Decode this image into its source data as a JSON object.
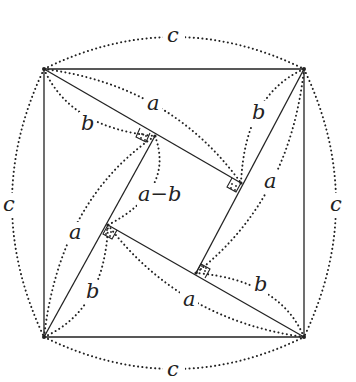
{
  "diagram": {
    "stroke_color": "#222222",
    "background": "#ffffff",
    "outer_square": {
      "corners": [
        [
          44,
          69
        ],
        [
          304,
          69
        ],
        [
          304,
          337
        ],
        [
          44,
          337
        ]
      ],
      "side_label": "c"
    },
    "inner_square": {
      "corners": [
        [
          155,
          136
        ],
        [
          241,
          183
        ],
        [
          196,
          273
        ],
        [
          108,
          225
        ]
      ],
      "side_label": "a−b"
    },
    "labels": {
      "c_top": "c",
      "c_left": "c",
      "c_right": "c",
      "c_bottom": "c",
      "a_top": "a",
      "b_top": "b",
      "a_right": "a",
      "b_right": "b",
      "a_left": "a",
      "b_left": "b",
      "a_bottom": "a",
      "b_bottom": "b",
      "a_minus_b": "a−b"
    }
  }
}
